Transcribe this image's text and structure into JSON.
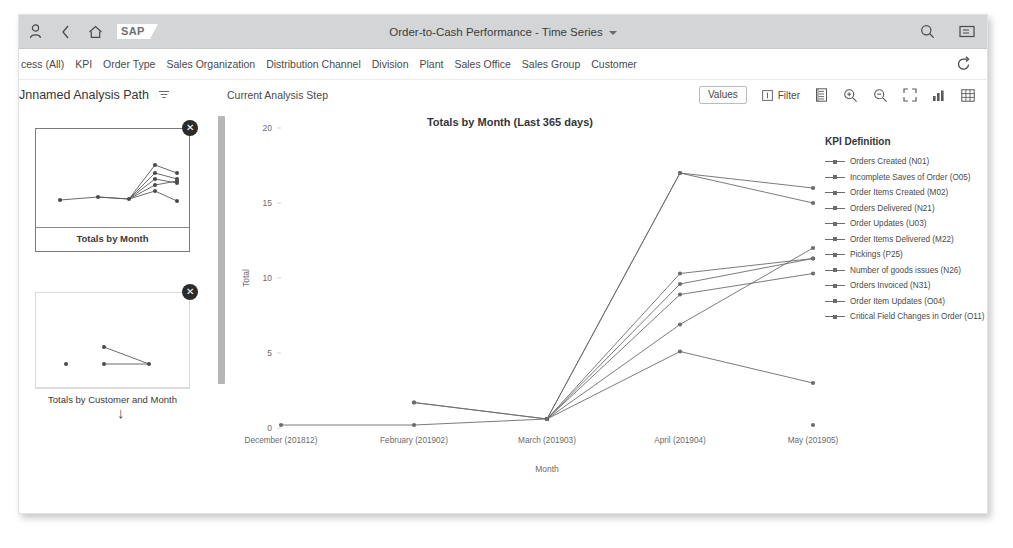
{
  "shell": {
    "title": "Order-to-Cash Performance - Time Series",
    "logo": "SAP",
    "icons": {
      "user": "user-icon",
      "back": "back-chevron-icon",
      "home": "home-icon",
      "search": "search-icon",
      "overflow": "menu-icon"
    }
  },
  "filter_bar": {
    "items": [
      "cess (All)",
      "KPI",
      "Order Type",
      "Sales Organization",
      "Distribution Channel",
      "Division",
      "Plant",
      "Sales Office",
      "Sales Group",
      "Customer"
    ],
    "refresh_icon": "refresh-icon"
  },
  "toolbar": {
    "analysis_path": "Jnnamed Analysis Path",
    "path_menu_icon": "filter-menu-icon",
    "current_step": "Current Analysis Step",
    "values_label": "Values",
    "filter_label": "Filter",
    "filter_icon": "filter-icon",
    "icons": [
      "legend-icon",
      "zoom-in-icon",
      "zoom-out-icon",
      "fullscreen-icon",
      "chart-type-icon",
      "table-view-icon"
    ]
  },
  "sidebar": {
    "steps": [
      {
        "caption": "Totals by Month",
        "selected": true,
        "close_icon": "close-icon"
      },
      {
        "caption": "Totals by Customer and Month",
        "selected": false,
        "close_icon": "close-icon"
      }
    ],
    "arrow_icon": "arrow-down-icon"
  },
  "legend": {
    "title": "KPI Definition"
  },
  "chart_data": {
    "type": "line",
    "title": "Totals by Month (Last 365 days)",
    "xlabel": "Month",
    "ylabel": "Total",
    "categories": [
      "December (201812)",
      "February (201902)",
      "March (201903)",
      "April (201904)",
      "May (201905)"
    ],
    "ylim": [
      0,
      20
    ],
    "yticks": [
      0,
      5,
      10,
      15,
      20
    ],
    "grid": false,
    "legend_position": "right",
    "series": [
      {
        "name": "Orders Created (N01)",
        "color": "#6c6c6c",
        "values": [
          null,
          1.7,
          0.6,
          17.0,
          16.0
        ]
      },
      {
        "name": "Incomplete Saves of Order (O05)",
        "color": "#6c6c6c",
        "values": [
          null,
          1.7,
          0.6,
          17.0,
          15.0
        ]
      },
      {
        "name": "Order Items Created (M02)",
        "color": "#6c6c6c",
        "values": [
          null,
          null,
          0.6,
          10.3,
          11.3
        ]
      },
      {
        "name": "Orders Delivered (N21)",
        "color": "#6c6c6c",
        "values": [
          null,
          null,
          0.6,
          9.6,
          11.3
        ]
      },
      {
        "name": "Order Updates (U03)",
        "color": "#6c6c6c",
        "values": [
          null,
          null,
          0.6,
          8.9,
          10.3
        ]
      },
      {
        "name": "Order Items Delivered (M22)",
        "color": "#6c6c6c",
        "values": [
          null,
          null,
          0.6,
          6.9,
          12.0
        ]
      },
      {
        "name": "Pickings (P25)",
        "color": "#6c6c6c",
        "values": [
          null,
          null,
          0.6,
          5.1,
          3.0
        ]
      },
      {
        "name": "Number of goods issues (N26)",
        "color": "#6c6c6c",
        "values": [
          0.2,
          0.2,
          0.6,
          null,
          null
        ]
      },
      {
        "name": "Orders Invoiced (N31)",
        "color": "#6c6c6c",
        "values": [
          null,
          null,
          null,
          null,
          0.2
        ]
      },
      {
        "name": "Order Item Updates (O04)",
        "color": "#6c6c6c",
        "values": [
          null,
          null,
          null,
          null,
          null
        ]
      },
      {
        "name": "Critical Field Changes in Order (O11)",
        "color": "#6c6c6c",
        "values": [
          null,
          null,
          null,
          null,
          null
        ]
      }
    ]
  }
}
